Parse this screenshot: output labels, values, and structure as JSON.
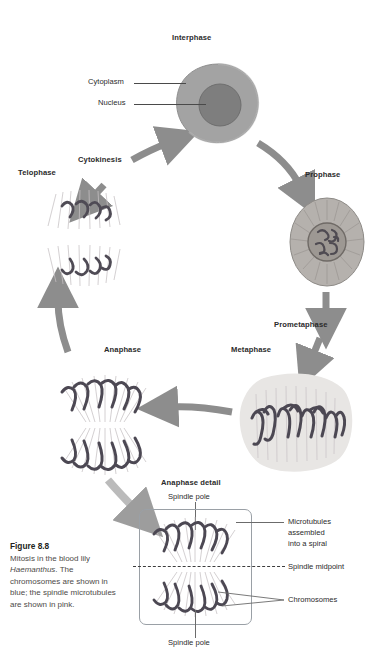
{
  "figure": {
    "number": "Figure 8.8",
    "caption_before": "Mitosis in the blood lily ",
    "species": "Haemanthus",
    "caption_after": ". The chromosomes are shown in blue; the spindle microtubules are shown in pink."
  },
  "cycle": {
    "stages": [
      {
        "id": "interphase",
        "label": "Interphase"
      },
      {
        "id": "prophase",
        "label": "Prophase"
      },
      {
        "id": "prometaphase",
        "label": "Prometaphase"
      },
      {
        "id": "metaphase",
        "label": "Metaphase"
      },
      {
        "id": "anaphase",
        "label": "Anaphase"
      },
      {
        "id": "telophase",
        "label": "Telophase"
      },
      {
        "id": "cytokinesis",
        "label": "Cytokinesis"
      }
    ]
  },
  "interphase_labels": {
    "cytoplasm": "Cytoplasm",
    "nucleus": "Nucleus"
  },
  "detail": {
    "title": "Anaphase detail",
    "spindle_pole_top": "Spindle pole",
    "spindle_pole_bottom": "Spindle pole",
    "microtubules": "Microtubules\nassembled\ninto a spiral",
    "microtubules_l1": "Microtubules",
    "microtubules_l2": "assembled",
    "microtubules_l3": "into a spiral",
    "midpoint": "Spindle midpoint",
    "chromosomes": "Chromosomes"
  },
  "colors": {
    "arrow": "#8d8d8d",
    "cell_cytoplasm": "#9b9b9b",
    "cell_nucleus": "#7a7a7a",
    "chromosome": "#5a5a66",
    "spindle": "#b9b2b6",
    "text": "#231f20",
    "caption": "#4d4a48",
    "box_border": "#9aa0a6"
  }
}
